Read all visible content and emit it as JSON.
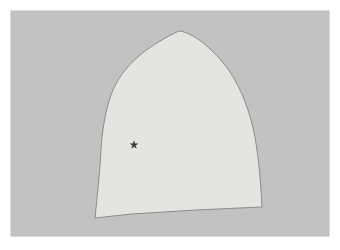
{
  "figure": {
    "title": "",
    "canvas": {
      "width": 340,
      "height": 250,
      "background_color": "#ffffff"
    },
    "panel": {
      "name": "plot-panel",
      "x": 11,
      "y": 11,
      "width": 318,
      "height": 225,
      "fill_color": "#c2c2c2",
      "edge_color": "#bcbcbc"
    },
    "region": {
      "name": "pointed-arch-region",
      "fill_color": "#e4e4e1",
      "stroke_color": "#8c8c8c",
      "stroke_width": 1,
      "path": "M 179 31 C 168 36 152 45 140 55 C 126 67 117 79 111 95 C 105 112 102 132 101 150 C 100 170 97 198 95 218 L 132 214 L 196 210 L 262 207 C 261 186 259 160 255 137 C 250 112 242 90 230 72 C 220 57 205 43 193 36 C 187 33 183 31 179 31 Z",
      "vertices": [
        [
          179,
          31
        ],
        [
          140,
          55
        ],
        [
          111,
          95
        ],
        [
          101,
          150
        ],
        [
          95,
          218
        ],
        [
          196,
          210
        ],
        [
          262,
          207
        ],
        [
          255,
          137
        ],
        [
          230,
          72
        ],
        [
          193,
          36
        ]
      ]
    },
    "marker": {
      "name": "star-marker",
      "symbol": "star",
      "x": 134,
      "y": 145,
      "size": 8,
      "color": "#3a3a3a"
    }
  }
}
